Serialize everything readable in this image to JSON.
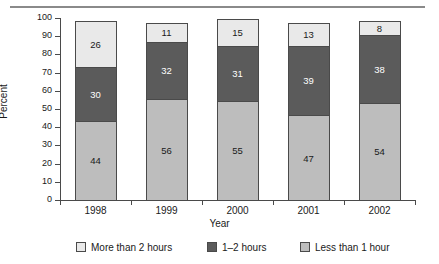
{
  "chart_data": {
    "type": "bar",
    "stacked": true,
    "title": "",
    "xlabel": "Year",
    "ylabel": "Percent",
    "categories": [
      "1998",
      "1999",
      "2000",
      "2001",
      "2002"
    ],
    "ylim": [
      0,
      100
    ],
    "yticks": [
      0,
      10,
      20,
      30,
      40,
      50,
      60,
      70,
      80,
      90,
      100
    ],
    "grid": false,
    "legend_position": "bottom",
    "series": [
      {
        "name": "Less than 1 hour",
        "values": [
          44,
          56,
          55,
          47,
          54
        ],
        "color": "#bdbdbd",
        "stack_order": 1
      },
      {
        "name": "1–2 hours",
        "values": [
          30,
          32,
          31,
          39,
          38
        ],
        "color": "#5b5b5b",
        "stack_order": 2
      },
      {
        "name": "More than 2 hours",
        "values": [
          26,
          11,
          15,
          13,
          8
        ],
        "color": "#e9e9e9",
        "stack_order": 3
      }
    ]
  },
  "axis": {
    "y_title": "Percent",
    "x_title": "Year",
    "y_tick_labels": [
      "100",
      "90",
      "80",
      "70",
      "60",
      "50",
      "40",
      "30",
      "20",
      "10",
      "0"
    ],
    "x_tick_labels": [
      "1998",
      "1999",
      "2000",
      "2001",
      "2002"
    ]
  },
  "legend": {
    "items": [
      {
        "label": "More than 2 hours",
        "swatch": "light-gray"
      },
      {
        "label": "1–2 hours",
        "swatch": "dark-gray"
      },
      {
        "label": "Less than 1 hour",
        "swatch": "medium-gray"
      }
    ]
  },
  "bars": [
    {
      "year": "1998",
      "top": "26",
      "mid": "30",
      "bot": "44"
    },
    {
      "year": "1999",
      "top": "11",
      "mid": "32",
      "bot": "56"
    },
    {
      "year": "2000",
      "top": "15",
      "mid": "31",
      "bot": "55"
    },
    {
      "year": "2001",
      "top": "13",
      "mid": "39",
      "bot": "47"
    },
    {
      "year": "2002",
      "top": "8",
      "mid": "38",
      "bot": "54"
    }
  ],
  "colors": {
    "more_than_2_hours": "#e9e9e9",
    "one_to_two_hours": "#5b5b5b",
    "less_than_1_hour": "#bdbdbd",
    "axis": "#4a4a4a",
    "rule": "#8a8a8a"
  }
}
